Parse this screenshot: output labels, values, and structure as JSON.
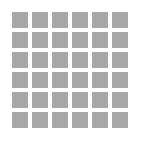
{
  "figure": {
    "name": "square-grid-pattern",
    "width_px": 146,
    "height_px": 145,
    "background_color": "#ffffff"
  },
  "grid": {
    "rows": 6,
    "columns": 6,
    "cell_count": 36,
    "cell_size_px": 16,
    "gap_px": 4,
    "margin_left_px": 12,
    "margin_top_px": 12,
    "cell_color": "#a8a8a8",
    "cells": [
      {
        "row": 1,
        "col": 1,
        "color": "#a8a8a8"
      },
      {
        "row": 1,
        "col": 2,
        "color": "#a8a8a8"
      },
      {
        "row": 1,
        "col": 3,
        "color": "#a8a8a8"
      },
      {
        "row": 1,
        "col": 4,
        "color": "#a8a8a8"
      },
      {
        "row": 1,
        "col": 5,
        "color": "#a8a8a8"
      },
      {
        "row": 1,
        "col": 6,
        "color": "#a8a8a8"
      },
      {
        "row": 2,
        "col": 1,
        "color": "#a8a8a8"
      },
      {
        "row": 2,
        "col": 2,
        "color": "#a8a8a8"
      },
      {
        "row": 2,
        "col": 3,
        "color": "#a8a8a8"
      },
      {
        "row": 2,
        "col": 4,
        "color": "#a8a8a8"
      },
      {
        "row": 2,
        "col": 5,
        "color": "#a8a8a8"
      },
      {
        "row": 2,
        "col": 6,
        "color": "#a8a8a8"
      },
      {
        "row": 3,
        "col": 1,
        "color": "#a8a8a8"
      },
      {
        "row": 3,
        "col": 2,
        "color": "#a8a8a8"
      },
      {
        "row": 3,
        "col": 3,
        "color": "#a8a8a8"
      },
      {
        "row": 3,
        "col": 4,
        "color": "#a8a8a8"
      },
      {
        "row": 3,
        "col": 5,
        "color": "#a8a8a8"
      },
      {
        "row": 3,
        "col": 6,
        "color": "#a8a8a8"
      },
      {
        "row": 4,
        "col": 1,
        "color": "#a8a8a8"
      },
      {
        "row": 4,
        "col": 2,
        "color": "#a8a8a8"
      },
      {
        "row": 4,
        "col": 3,
        "color": "#a8a8a8"
      },
      {
        "row": 4,
        "col": 4,
        "color": "#a8a8a8"
      },
      {
        "row": 4,
        "col": 5,
        "color": "#a8a8a8"
      },
      {
        "row": 4,
        "col": 6,
        "color": "#a8a8a8"
      },
      {
        "row": 5,
        "col": 1,
        "color": "#a8a8a8"
      },
      {
        "row": 5,
        "col": 2,
        "color": "#a8a8a8"
      },
      {
        "row": 5,
        "col": 3,
        "color": "#a8a8a8"
      },
      {
        "row": 5,
        "col": 4,
        "color": "#a8a8a8"
      },
      {
        "row": 5,
        "col": 5,
        "color": "#a8a8a8"
      },
      {
        "row": 5,
        "col": 6,
        "color": "#a8a8a8"
      },
      {
        "row": 6,
        "col": 1,
        "color": "#a8a8a8"
      },
      {
        "row": 6,
        "col": 2,
        "color": "#a8a8a8"
      },
      {
        "row": 6,
        "col": 3,
        "color": "#a8a8a8"
      },
      {
        "row": 6,
        "col": 4,
        "color": "#a8a8a8"
      },
      {
        "row": 6,
        "col": 5,
        "color": "#a8a8a8"
      },
      {
        "row": 6,
        "col": 6,
        "color": "#a8a8a8"
      }
    ]
  }
}
